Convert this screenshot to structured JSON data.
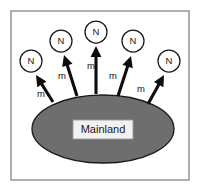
{
  "figure": {
    "background_color": "#ffffff",
    "frame": {
      "stroke_color": "#8e8e8e",
      "x": 11,
      "y": 11,
      "width": 178,
      "height": 169
    }
  },
  "mainland": {
    "label": "Mainland",
    "fill_color": "#6e6e6e",
    "stroke_color": "#1a1a1a",
    "cx": 103,
    "cy": 129,
    "rx": 71,
    "ry": 34,
    "label_box": {
      "x": 73,
      "y": 120,
      "width": 60,
      "height": 19,
      "fill_color": "#f2f2f2"
    }
  },
  "nodes": [
    {
      "id": "node-1",
      "label": "N",
      "cx": 31,
      "cy": 61,
      "r": 11
    },
    {
      "id": "node-2",
      "label": "N",
      "cx": 61,
      "cy": 41,
      "r": 11
    },
    {
      "id": "node-3",
      "label": "N",
      "cx": 96,
      "cy": 32,
      "r": 11
    },
    {
      "id": "node-4",
      "label": "N",
      "cx": 133,
      "cy": 41,
      "r": 11
    },
    {
      "id": "node-5",
      "label": "N",
      "cx": 169,
      "cy": 61,
      "r": 11
    }
  ],
  "arrows": [
    {
      "id": "arrow-1",
      "label": "m",
      "tail_x": 53,
      "tail_y": 102,
      "head_x": 36,
      "head_y": 75,
      "label_x": 41,
      "label_y": 94
    },
    {
      "id": "arrow-2",
      "label": "m",
      "tail_x": 77,
      "tail_y": 96,
      "head_x": 64,
      "head_y": 55,
      "label_x": 62,
      "label_y": 76
    },
    {
      "id": "arrow-3",
      "label": "m",
      "tail_x": 96,
      "tail_y": 94,
      "head_x": 96,
      "head_y": 46,
      "label_x": 91,
      "label_y": 66
    },
    {
      "id": "arrow-4",
      "label": "m",
      "tail_x": 118,
      "tail_y": 96,
      "head_x": 131,
      "head_y": 56,
      "label_x": 113,
      "label_y": 76
    },
    {
      "id": "arrow-5",
      "label": "m",
      "tail_x": 148,
      "tail_y": 104,
      "head_x": 164,
      "head_y": 75,
      "label_x": 141,
      "label_y": 89
    }
  ],
  "colors": {
    "land_fill": "#6e6e6e",
    "outline": "#1a1a1a",
    "arrow": "#0d0d0d",
    "frame": "#8e8e8e",
    "label_box": "#f2f2f2"
  }
}
